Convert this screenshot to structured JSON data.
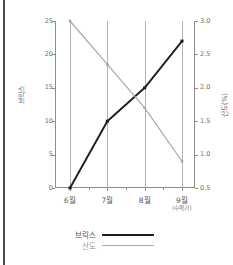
{
  "chart_data": {
    "type": "line",
    "title": "",
    "xlabel": "",
    "ylabel": "브릭스",
    "y2label": "산도(%)",
    "grid": true,
    "legend_position": "bottom",
    "categories": [
      "6월",
      "7월",
      "8월",
      "9월"
    ],
    "category_sublabels": [
      "",
      "",
      "",
      "(수확기)"
    ],
    "x": [
      0,
      1,
      2,
      3
    ],
    "ylim": [
      0,
      25
    ],
    "y2lim": [
      0.5,
      3.0
    ],
    "yticks": [
      0,
      5,
      10,
      15,
      20,
      25
    ],
    "ytick_labels": [
      "0",
      "5",
      "10",
      "15",
      "20",
      "25"
    ],
    "y2ticks": [
      0.5,
      1.0,
      1.5,
      2.0,
      2.5,
      3.0
    ],
    "y2tick_labels": [
      "0.5",
      "1.0",
      "1.5",
      "2.0",
      "2.5",
      "3.0"
    ],
    "series": [
      {
        "name": "브릭스",
        "axis": "left",
        "color": "#1d1d1d",
        "values": [
          0,
          10,
          15,
          22
        ]
      },
      {
        "name": "산도",
        "axis": "right",
        "color": "#a8a8a8",
        "values": [
          3.0,
          2.35,
          1.7,
          0.9
        ]
      }
    ]
  },
  "legend": {
    "items": [
      {
        "label": "브릭스"
      },
      {
        "label": "산도"
      }
    ]
  },
  "axes": {
    "left_title": "브릭스",
    "right_title": "산도(%)"
  }
}
